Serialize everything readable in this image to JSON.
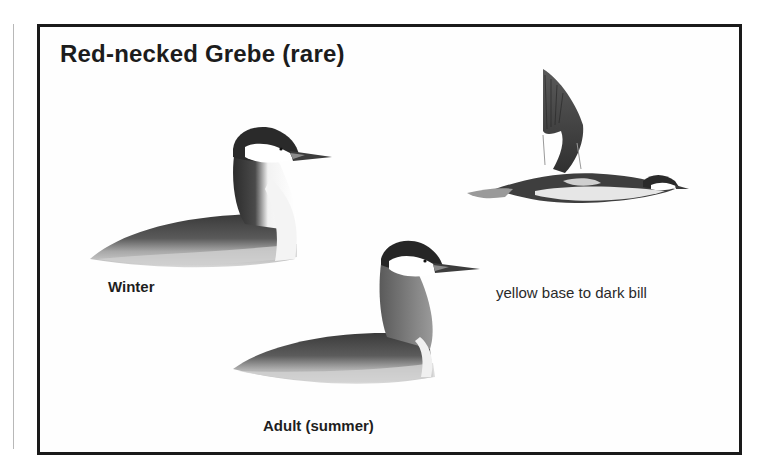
{
  "plate": {
    "title": "Red-necked Grebe (rare)",
    "captions": {
      "winter": "Winter",
      "adult_summer": "Adult (summer)",
      "bill_note": "yellow base to dark bill"
    },
    "illustrations": [
      {
        "name": "winter-grebe-swimming",
        "label": "Winter"
      },
      {
        "name": "grebe-in-flight",
        "label": ""
      },
      {
        "name": "adult-summer-grebe-swimming",
        "label": "Adult (summer)"
      }
    ],
    "colors": {
      "frame": "#1a1a1a",
      "background": "#ffffff",
      "text": "#1c1c1c"
    }
  }
}
